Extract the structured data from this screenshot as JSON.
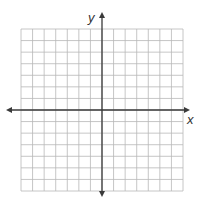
{
  "diagram": {
    "type": "coordinate-plane",
    "grid": {
      "columns": 14,
      "rows": 14,
      "left": 21,
      "top": 29,
      "right": 183,
      "bottom": 191,
      "line_color": "#b8b8b8",
      "background": "#ffffff"
    },
    "axes": {
      "color": "#3a3a3a",
      "x_axis": {
        "label": "x",
        "y": 110,
        "x_start": 6,
        "x_end": 190
      },
      "y_axis": {
        "label": "y",
        "x": 102,
        "y_start": 12,
        "y_end": 197
      }
    }
  }
}
